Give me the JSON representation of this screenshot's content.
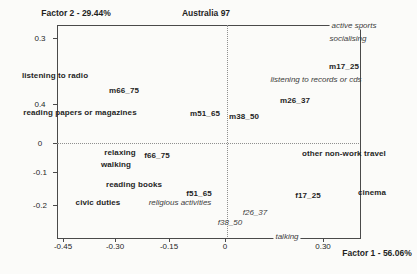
{
  "title": "Australia 97",
  "y_axis_title": "Factor 2 - 29.44%",
  "x_axis_title": "Factor 1 - 56.06%",
  "colors": {
    "background": "#fbfbf9",
    "ink": "#1f1f1f",
    "muted_ink": "#3c3c3c",
    "frame_line": "#4a4a4a",
    "dotted_line": "#8f8f8f"
  },
  "layout": {
    "box": {
      "left": 57,
      "top": 25,
      "right": 359,
      "bottom": 237
    },
    "zero_line_y": 143,
    "zero_line_x": 227,
    "y_ticks": [
      {
        "label": "0.3",
        "py": 38
      },
      {
        "label": "0.4",
        "py": 104
      },
      {
        "label": "0",
        "py": 143
      },
      {
        "label": "-0.1",
        "py": 172
      },
      {
        "label": "-0.2",
        "py": 205
      }
    ],
    "x_ticks": [
      {
        "label": "-0.45",
        "px": 63
      },
      {
        "label": "-0.30",
        "px": 115
      },
      {
        "label": "-0.15",
        "px": 169
      },
      {
        "label": "0",
        "px": 225
      },
      {
        "label": "0.30",
        "px": 323
      }
    ],
    "labels": [
      {
        "text": "m17_25",
        "x": 344,
        "y": 66,
        "style": "pb",
        "kind": "point"
      },
      {
        "text": "m26_37",
        "x": 295,
        "y": 100,
        "style": "pb",
        "kind": "point"
      },
      {
        "text": "m38_50",
        "x": 244,
        "y": 116,
        "style": "pb",
        "kind": "point"
      },
      {
        "text": "m51_65",
        "x": 205,
        "y": 113,
        "style": "pb",
        "kind": "point"
      },
      {
        "text": "m66_75",
        "x": 124,
        "y": 90,
        "style": "pb",
        "kind": "point"
      },
      {
        "text": "f66_75",
        "x": 157,
        "y": 155,
        "style": "pb",
        "kind": "point"
      },
      {
        "text": "f51_65",
        "x": 199,
        "y": 193,
        "style": "pb",
        "kind": "point"
      },
      {
        "text": "f17_25",
        "x": 308,
        "y": 195,
        "style": "pb",
        "kind": "point"
      },
      {
        "text": "f26_37",
        "x": 255,
        "y": 212,
        "style": "pi",
        "kind": "point"
      },
      {
        "text": "f38_50",
        "x": 230,
        "y": 222,
        "style": "pi",
        "kind": "point"
      },
      {
        "text": "listening to radio",
        "x": 55,
        "y": 75,
        "style": "ab",
        "kind": "activity"
      },
      {
        "text": "reading papers or magazines",
        "x": 80,
        "y": 112,
        "style": "ab",
        "kind": "activity"
      },
      {
        "text": "relaxing",
        "x": 120,
        "y": 152,
        "style": "ab",
        "kind": "activity"
      },
      {
        "text": "walking",
        "x": 116,
        "y": 164,
        "style": "ab",
        "kind": "activity"
      },
      {
        "text": "reading books",
        "x": 134,
        "y": 184,
        "style": "ab",
        "kind": "activity"
      },
      {
        "text": "civic duties",
        "x": 98,
        "y": 202,
        "style": "ab",
        "kind": "activity"
      },
      {
        "text": "other non-work travel",
        "x": 344,
        "y": 153,
        "style": "ab",
        "kind": "activity"
      },
      {
        "text": "cinema",
        "x": 372,
        "y": 192,
        "style": "ab",
        "kind": "activity"
      },
      {
        "text": "active sports",
        "x": 354,
        "y": 25,
        "style": "ai",
        "kind": "activity",
        "bg": true
      },
      {
        "text": "socialising",
        "x": 348,
        "y": 38,
        "style": "ai",
        "kind": "activity"
      },
      {
        "text": "listening to records or cds",
        "x": 316,
        "y": 79,
        "style": "ai",
        "kind": "activity"
      },
      {
        "text": "religious activities",
        "x": 180,
        "y": 202,
        "style": "ai",
        "kind": "activity"
      },
      {
        "text": "talking",
        "x": 287,
        "y": 236,
        "style": "ai",
        "kind": "activity",
        "bg": true
      }
    ]
  },
  "chart_data": {
    "type": "scatter",
    "title": "Australia 97",
    "xlabel": "Factor 1 - 56.06%",
    "ylabel": "Factor 2 - 29.44%",
    "xlim": [
      -0.47,
      0.37
    ],
    "ylim": [
      -0.29,
      0.36
    ],
    "grid": "zero-lines dotted",
    "x_tick_labels": [
      "-0.45",
      "-0.30",
      "-0.15",
      "0",
      "0.30"
    ],
    "y_tick_labels": [
      "0.3",
      "0.4",
      "0",
      "-0.1",
      "-0.2"
    ],
    "series": [
      {
        "name": "age-sex groups (bold)",
        "points": [
          {
            "label": "m17_25",
            "x": 0.331,
            "y": 0.233
          },
          {
            "label": "m26_37",
            "x": 0.194,
            "y": 0.13
          },
          {
            "label": "m38_50",
            "x": 0.053,
            "y": 0.082
          },
          {
            "label": "m51_65",
            "x": -0.056,
            "y": 0.091
          },
          {
            "label": "m66_75",
            "x": -0.281,
            "y": 0.161
          },
          {
            "label": "f66_75",
            "x": -0.189,
            "y": -0.036
          },
          {
            "label": "f51_65",
            "x": -0.072,
            "y": -0.152
          },
          {
            "label": "f17_25",
            "x": 0.231,
            "y": -0.158
          }
        ]
      },
      {
        "name": "age-sex groups (italic)",
        "points": [
          {
            "label": "f26_37",
            "x": 0.083,
            "y": -0.209
          },
          {
            "label": "f38_50",
            "x": 0.014,
            "y": -0.239
          }
        ]
      },
      {
        "name": "activities (bold)",
        "points": [
          {
            "label": "listening to radio",
            "x": -0.472,
            "y": 0.206
          },
          {
            "label": "reading papers or magazines",
            "x": -0.403,
            "y": 0.094
          },
          {
            "label": "relaxing",
            "x": -0.292,
            "y": -0.027
          },
          {
            "label": "walking",
            "x": -0.303,
            "y": -0.064
          },
          {
            "label": "reading books",
            "x": -0.253,
            "y": -0.124
          },
          {
            "label": "civic duties",
            "x": -0.353,
            "y": -0.179
          },
          {
            "label": "other non-work travel",
            "x": 0.331,
            "y": -0.03
          },
          {
            "label": "cinema",
            "x": 0.408,
            "y": -0.148
          }
        ]
      },
      {
        "name": "activities (italic / supplementary)",
        "points": [
          {
            "label": "active sports",
            "x": 0.358,
            "y": 0.358
          },
          {
            "label": "socialising",
            "x": 0.342,
            "y": 0.318
          },
          {
            "label": "listening to records or cds",
            "x": 0.253,
            "y": 0.194
          },
          {
            "label": "religious activities",
            "x": -0.125,
            "y": -0.179
          },
          {
            "label": "talking",
            "x": 0.172,
            "y": -0.282
          }
        ]
      }
    ]
  }
}
